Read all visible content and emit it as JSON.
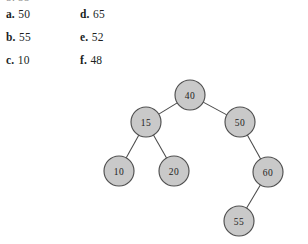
{
  "page": {
    "background_color": "#ffffff",
    "width": 308,
    "height": 244,
    "clipped_top_text": "b. 55"
  },
  "question_options": {
    "left_column": [
      {
        "label": "a.",
        "value": "50"
      },
      {
        "label": "b.",
        "value": "55"
      },
      {
        "label": "c.",
        "value": "10"
      }
    ],
    "right_column": [
      {
        "label": "d.",
        "value": "65"
      },
      {
        "label": "e.",
        "value": "52"
      },
      {
        "label": "f.",
        "value": "48"
      }
    ]
  },
  "diagram": {
    "type": "binary-tree",
    "node_fill_color": "#c9c9c9",
    "node_stroke_color": "#4f4f4f",
    "edge_color": "#4a4a4a",
    "node_radius": 15,
    "nodes": [
      {
        "id": "n40",
        "value": "40",
        "cx": 190,
        "cy": 95,
        "role": "root"
      },
      {
        "id": "n15",
        "value": "15",
        "cx": 146,
        "cy": 122,
        "role": "left-child"
      },
      {
        "id": "n50",
        "value": "50",
        "cx": 240,
        "cy": 122,
        "role": "right-child"
      },
      {
        "id": "n10",
        "value": "10",
        "cx": 119,
        "cy": 171,
        "role": "leaf"
      },
      {
        "id": "n20",
        "value": "20",
        "cx": 174,
        "cy": 171,
        "role": "leaf"
      },
      {
        "id": "n60",
        "value": "60",
        "cx": 268,
        "cy": 172,
        "role": "right-child"
      },
      {
        "id": "n55",
        "value": "55",
        "cx": 239,
        "cy": 221,
        "role": "leaf"
      }
    ],
    "edges": [
      {
        "from": "n40",
        "to": "n15"
      },
      {
        "from": "n40",
        "to": "n50"
      },
      {
        "from": "n15",
        "to": "n10"
      },
      {
        "from": "n15",
        "to": "n20"
      },
      {
        "from": "n50",
        "to": "n60"
      },
      {
        "from": "n60",
        "to": "n55"
      }
    ]
  }
}
